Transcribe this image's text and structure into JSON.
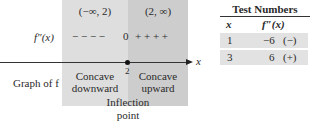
{
  "diagram": {
    "intervals": [
      {
        "label": "(−∞, 2)",
        "color": "#dedede"
      },
      {
        "label": "(2, ∞)",
        "color": "#cdcdcd"
      }
    ],
    "sign_row": {
      "label": "f″(x)",
      "left_signs": "− − − −",
      "zero": "0",
      "right_signs": "+ + + +"
    },
    "axis": {
      "variable_label": "x",
      "point_label": "2"
    },
    "graph_row": {
      "label": "Graph of f",
      "left": [
        "Concave",
        "downward"
      ],
      "right": [
        "Concave",
        "upward"
      ]
    },
    "annotation": [
      "Inflection",
      "point"
    ]
  },
  "test_table": {
    "title": "Test Numbers",
    "headers": [
      "x",
      "f″(x)"
    ],
    "rows": [
      {
        "x": "1",
        "value": "−6",
        "sign": "(−)"
      },
      {
        "x": "3",
        "value": "6",
        "sign": "(+)"
      }
    ]
  }
}
